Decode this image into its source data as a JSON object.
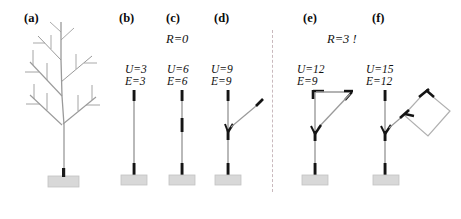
{
  "figure": {
    "width": 461,
    "height": 219,
    "background": "#ffffff",
    "divider": {
      "x": 272,
      "y_top": 30,
      "y_bottom": 192,
      "color": "#c9b9bd",
      "style": "dashed"
    }
  },
  "panels": [
    {
      "id": "a",
      "label": "(a)",
      "label_x": 24,
      "label_y": 12,
      "kind": "tree",
      "description": "branched tree with pedestal base"
    },
    {
      "id": "b",
      "label": "(b)",
      "label_x": 119,
      "label_y": 12,
      "kind": "stem",
      "U": "U=3",
      "E": "E=3",
      "ue_x": 125,
      "ue_y": 63
    },
    {
      "id": "c",
      "label": "(c)",
      "label_x": 166,
      "label_y": 12,
      "kind": "stem-segmented",
      "U": "U=6",
      "E": "E=6",
      "ue_x": 167,
      "ue_y": 63
    },
    {
      "id": "d",
      "label": "(d)",
      "label_x": 214,
      "label_y": 12,
      "kind": "stem-branch",
      "U": "U=9",
      "E": "E=9",
      "ue_x": 211,
      "ue_y": 63
    },
    {
      "id": "e",
      "label": "(e)",
      "label_x": 303,
      "label_y": 12,
      "kind": "stem-triangle",
      "U": "U=12",
      "E": "E=9",
      "ue_x": 297,
      "ue_y": 63
    },
    {
      "id": "f",
      "label": "(f)",
      "label_x": 372,
      "label_y": 12,
      "kind": "stem-diamond",
      "U": "U=15",
      "E": "E=12",
      "ue_x": 366,
      "ue_y": 63
    }
  ],
  "annotations": {
    "left_group": {
      "text": "R=0",
      "x": 166,
      "y": 33
    },
    "right_group": {
      "text": "R=3 !",
      "x": 327,
      "y": 33
    }
  },
  "colors": {
    "stem_light": "#a8a8a8",
    "stem_dark": "#111111",
    "branch_gray": "#8f8f8f",
    "pedestal_fill": "#d8d8d8",
    "pedestal_edge": "#b4b4b4",
    "divider": "#c9b9bd",
    "text": "#111111"
  }
}
